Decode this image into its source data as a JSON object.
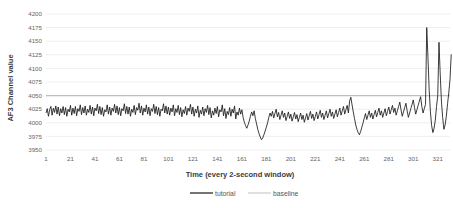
{
  "chart_data": {
    "type": "line",
    "title": "",
    "xlabel": "Time (every 2-second window)",
    "ylabel": "AF3 Channel value",
    "ylim": [
      3950,
      4200
    ],
    "ytick_step": 25,
    "yticks": [
      3950,
      3975,
      4000,
      4025,
      4050,
      4075,
      4100,
      4125,
      4150,
      4175,
      4200
    ],
    "ytick_labels": [
      "3950",
      "3975",
      "4000",
      "4025",
      "4050",
      "4075",
      "4100",
      "4125",
      "4150",
      "4175",
      "4200"
    ],
    "xlim": [
      1,
      331
    ],
    "xtick_step": 20,
    "xticks": [
      1,
      21,
      41,
      61,
      81,
      101,
      121,
      141,
      161,
      181,
      201,
      221,
      241,
      261,
      281,
      301,
      321
    ],
    "xtick_labels": [
      "1",
      "21",
      "41",
      "61",
      "81",
      "101",
      "121",
      "141",
      "161",
      "181",
      "201",
      "221",
      "241",
      "261",
      "281",
      "301",
      "321"
    ],
    "grid": true,
    "legend_position": "bottom",
    "legend": [
      {
        "name": "tutorial",
        "color": "#1a1a1a",
        "style": "solid-dark"
      },
      {
        "name": "baseline",
        "color": "#bfbfbf",
        "style": "solid-light"
      }
    ],
    "series": [
      {
        "name": "baseline",
        "color": "#bfbfbf",
        "constant_value": 4050,
        "values": [
          4050,
          4050
        ]
      },
      {
        "name": "tutorial",
        "color": "#1a1a1a",
        "x_start": 1,
        "values": [
          4018,
          4026,
          4012,
          4024,
          4030,
          4014,
          4027,
          4019,
          4031,
          4016,
          4029,
          4013,
          4026,
          4018,
          4030,
          4015,
          4028,
          4012,
          4025,
          4020,
          4032,
          4014,
          4027,
          4017,
          4030,
          4013,
          4026,
          4021,
          4033,
          4015,
          4028,
          4018,
          4031,
          4014,
          4025,
          4019,
          4032,
          4016,
          4029,
          4013,
          4027,
          4022,
          4034,
          4017,
          4030,
          4015,
          4028,
          4012,
          4024,
          4020,
          4033,
          4016,
          4029,
          4014,
          4027,
          4021,
          4034,
          4018,
          4031,
          4015,
          4028,
          4013,
          4026,
          4022,
          4035,
          4017,
          4030,
          4016,
          4029,
          4012,
          4025,
          4019,
          4032,
          4015,
          4028,
          4023,
          4036,
          4018,
          4031,
          4014,
          4027,
          4020,
          4033,
          4016,
          4029,
          4013,
          4026,
          4021,
          4034,
          4017,
          4030,
          4015,
          4028,
          4012,
          4025,
          4022,
          4035,
          4018,
          4031,
          4016,
          4029,
          4014,
          4027,
          4020,
          4033,
          4013,
          4026,
          4019,
          4032,
          4015,
          4028,
          4011,
          4024,
          4017,
          4030,
          4014,
          4027,
          4021,
          4034,
          4016,
          4029,
          4012,
          4025,
          4018,
          4031,
          4010,
          4023,
          4016,
          4029,
          4013,
          4026,
          4019,
          4032,
          4015,
          4028,
          4009,
          4022,
          4014,
          4027,
          4017,
          4030,
          4011,
          4024,
          4020,
          4033,
          4013,
          4026,
          4008,
          4021,
          4015,
          4028,
          4012,
          4025,
          4018,
          4031,
          4007,
          4020,
          4014,
          4027,
          4016,
          4024,
          4010,
          4001,
          3995,
          3990,
          3996,
          4003,
          4012,
          4020,
          4013,
          4022,
          4008,
          3998,
          3988,
          3980,
          3974,
          3969,
          3972,
          3978,
          3985,
          3992,
          4000,
          4010,
          4018,
          4012,
          4021,
          4009,
          4017,
          4025,
          4011,
          4019,
          4006,
          4014,
          4022,
          4010,
          4018,
          4004,
          4012,
          4020,
          4008,
          4016,
          4003,
          4011,
          4019,
          4007,
          4015,
          4002,
          4010,
          4018,
          4006,
          4014,
          4001,
          4009,
          4017,
          4005,
          4013,
          4021,
          4008,
          4016,
          4004,
          4012,
          4020,
          4007,
          4015,
          4023,
          4010,
          4018,
          4006,
          4014,
          4022,
          4009,
          4017,
          4025,
          4012,
          4020,
          4008,
          4016,
          4024,
          4011,
          4019,
          4027,
          4014,
          4022,
          4030,
          4016,
          4024,
          4032,
          4018,
          4040,
          4047,
          4033,
          4020,
          4008,
          3996,
          3988,
          3982,
          3978,
          3984,
          3992,
          4000,
          4009,
          4017,
          4006,
          4014,
          4022,
          4010,
          4018,
          4007,
          4015,
          4023,
          4011,
          4019,
          4027,
          4014,
          4022,
          4010,
          4018,
          4026,
          4013,
          4021,
          4029,
          4016,
          4024,
          4032,
          4019,
          4027,
          4014,
          4022,
          4030,
          4038,
          4024,
          4012,
          4020,
          4028,
          4036,
          4022,
          4010,
          4018,
          4026,
          4034,
          4042,
          4028,
          4016,
          4024,
          4032,
          4040,
          4048,
          4030,
          4018,
          4026,
          4034,
          4175,
          4120,
          4060,
          4020,
          3995,
          3982,
          3990,
          4005,
          4030,
          4050,
          4148,
          4090,
          4040,
          4010,
          3988,
          3996,
          4012,
          4035,
          4055,
          4080,
          4126
        ]
      }
    ],
    "annotations": [
      {
        "label": "major-spike",
        "x": 322,
        "y": 4175
      },
      {
        "label": "secondary-spike",
        "x": 332,
        "y": 4148
      },
      {
        "label": "deep-trough",
        "x": 187,
        "y": 3969
      }
    ]
  },
  "legend": {
    "tutorial_label": "tutorial",
    "baseline_label": "baseline"
  },
  "axes": {
    "y_title": "AF3 Channel value",
    "x_title": "Time (every 2-second window)"
  }
}
